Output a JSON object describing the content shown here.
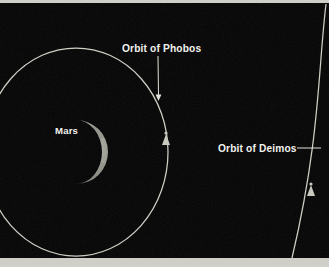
{
  "figure": {
    "name": "mars-moons-orbit-diagram",
    "background_color": "#050505",
    "orbit_color": "#cfcfc6",
    "label_color": "#f2f2ee",
    "frame_color": "#cfcfc8"
  },
  "labels": {
    "phobos_orbit": "Orbit of Phobos",
    "deimos_orbit": "Orbit of Deimos",
    "deimos_leader_dash": "——",
    "mars": "Mars"
  },
  "bodies": {
    "mars": {
      "name": "Mars",
      "center_x": 76,
      "center_y": 152,
      "radius": 32,
      "phase": "half-illuminated",
      "disc_color": "#9a9a92",
      "highlight_color": "#e6e6dc"
    },
    "phobos_moon": {
      "name": "Phobos",
      "x": 166,
      "y": 140
    },
    "deimos_moon": {
      "name": "Deimos",
      "x": 311,
      "y": 191
    }
  },
  "orbits": {
    "phobos": {
      "name": "Orbit of Phobos",
      "shape": "ellipse",
      "center_x": 76,
      "center_y": 152,
      "radius_x": 92,
      "radius_y": 104
    },
    "deimos": {
      "name": "Orbit of Deimos",
      "shape": "arc",
      "description": "large arc entering top-right and exiting bottom"
    }
  },
  "leaders": {
    "phobos": {
      "x": 158,
      "y_start": 56,
      "y_end": 101
    },
    "deimos": {
      "x_start": 297,
      "x_end": 321,
      "y": 148
    }
  }
}
